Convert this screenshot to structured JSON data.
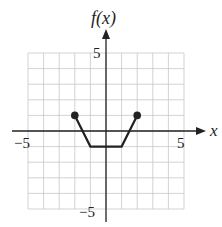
{
  "chart_data": {
    "type": "line",
    "title": "",
    "xlabel": "x",
    "ylabel": "f(x)",
    "xlim": [
      -5,
      5
    ],
    "ylim": [
      -5,
      5
    ],
    "grid": true,
    "x_ticks_labeled": [
      -5,
      5
    ],
    "y_ticks_labeled": [
      5,
      -5
    ],
    "tick_labels": {
      "x_neg": "−5",
      "x_pos": "5",
      "y_pos": "5",
      "y_neg": "−5"
    },
    "series": [
      {
        "name": "f(x)",
        "points": [
          [
            -2,
            1
          ],
          [
            -1,
            -1
          ],
          [
            1,
            -1
          ],
          [
            2,
            1
          ]
        ],
        "x": [
          -2,
          -1,
          1,
          2
        ],
        "y": [
          1,
          -1,
          -1,
          1
        ],
        "endpoints": "closed",
        "color": "#222222"
      }
    ]
  },
  "labels": {
    "y_axis": "f(x)",
    "x_axis": "x"
  },
  "colors": {
    "grid": "#c8c8c8",
    "axis": "#222222",
    "curve": "#222222"
  }
}
